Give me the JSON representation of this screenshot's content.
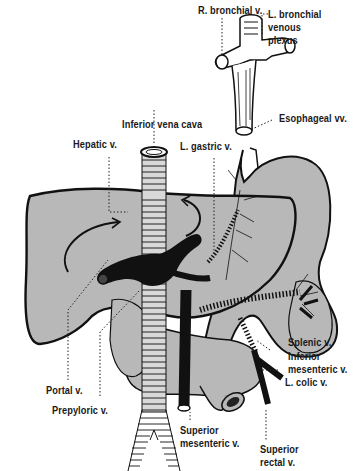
{
  "figure": {
    "colors": {
      "background": "#ffffff",
      "organ_fill": "#b8b8b8",
      "outline": "#111111",
      "vein_black": "#111111"
    }
  },
  "labels": {
    "r_bronchial": "R. bronchial v.",
    "l_bronchial": "L. bronchial\nvenous\nplexus",
    "esophageal": "Esophageal vv.",
    "inferior_vena_cava": "Inferior vena cava",
    "hepatic": "Hepatic v.",
    "l_gastric": "L. gastric v.",
    "splenic": "Splenic v.",
    "inferior_mesenteric": "Inferior\nmesenteric v.",
    "l_colic": "L. colic v.",
    "portal": "Portal v.",
    "prepyloric": "Prepyloric v.",
    "superior_mesenteric": "Superior\nmesenteric v.",
    "superior_rectal": "Superior\nrectal v."
  }
}
